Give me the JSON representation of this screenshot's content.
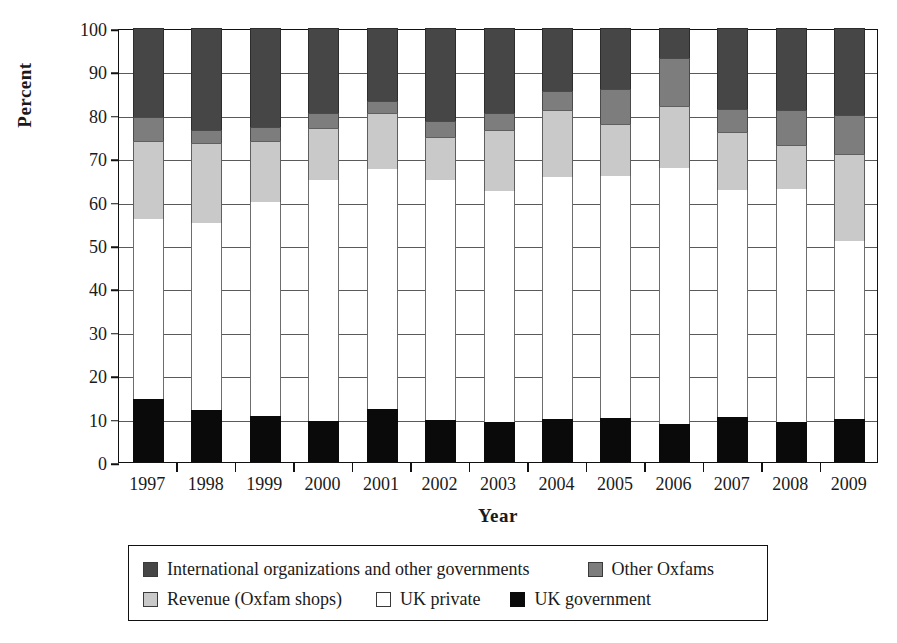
{
  "axes": {
    "ylabel": "Percent",
    "xlabel": "Year",
    "yticks": [
      "0",
      "10",
      "20",
      "30",
      "40",
      "50",
      "60",
      "70",
      "80",
      "90",
      "100"
    ]
  },
  "legend": {
    "items": [
      {
        "label": "International organizations and other governments",
        "key": "intl",
        "color": "#464646"
      },
      {
        "label": "Other Oxfams",
        "key": "other",
        "color": "#7d7d7d"
      },
      {
        "label": "Revenue (Oxfam shops)",
        "key": "shops",
        "color": "#c9c9c9"
      },
      {
        "label": "UK private",
        "key": "priv",
        "color": "#ffffff"
      },
      {
        "label": "UK government",
        "key": "gov",
        "color": "#0a0a0a"
      }
    ]
  },
  "chart_data": {
    "type": "bar",
    "stacked": true,
    "title": "",
    "xlabel": "Year",
    "ylabel": "Percent",
    "ylim": [
      0,
      100
    ],
    "grid": true,
    "legend_position": "bottom",
    "categories": [
      "1997",
      "1998",
      "1999",
      "2000",
      "2001",
      "2002",
      "2003",
      "2004",
      "2005",
      "2006",
      "2007",
      "2008",
      "2009"
    ],
    "series": [
      {
        "name": "UK government",
        "color": "#0a0a0a",
        "values": [
          14.5,
          12.0,
          10.7,
          9.4,
          12.2,
          9.7,
          9.3,
          10.0,
          10.1,
          8.8,
          10.3,
          9.2,
          10.0
        ]
      },
      {
        "name": "UK private",
        "color": "#ffffff",
        "values": [
          41.5,
          43.0,
          49.3,
          55.6,
          55.3,
          55.3,
          53.2,
          55.6,
          55.9,
          59.0,
          52.4,
          53.6,
          41.0
        ]
      },
      {
        "name": "Revenue (Oxfam shops)",
        "color": "#c9c9c9",
        "values": [
          18.0,
          18.5,
          14.0,
          12.0,
          13.0,
          10.0,
          14.0,
          15.4,
          12.0,
          14.2,
          13.3,
          10.2,
          20.0
        ]
      },
      {
        "name": "Other Oxfams",
        "color": "#7d7d7d",
        "values": [
          5.5,
          3.0,
          3.3,
          3.5,
          2.8,
          3.5,
          4.0,
          4.5,
          8.0,
          11.0,
          5.4,
          8.0,
          9.0
        ]
      },
      {
        "name": "International organizations and other governments",
        "color": "#464646",
        "values": [
          20.5,
          23.5,
          22.7,
          19.5,
          16.7,
          21.5,
          19.5,
          14.5,
          14.0,
          7.0,
          18.6,
          19.0,
          20.0
        ]
      }
    ],
    "stack_tops": {
      "1997": {
        "gov": 14.5,
        "priv": 56.0,
        "shops": 74.0,
        "other": 79.5,
        "intl": 100
      },
      "1998": {
        "gov": 12.0,
        "priv": 55.0,
        "shops": 73.5,
        "other": 76.5,
        "intl": 100
      },
      "1999": {
        "gov": 10.7,
        "priv": 60.0,
        "shops": 74.0,
        "other": 77.3,
        "intl": 100
      },
      "2000": {
        "gov": 9.4,
        "priv": 65.0,
        "shops": 77.0,
        "other": 80.5,
        "intl": 100
      },
      "2001": {
        "gov": 12.2,
        "priv": 67.5,
        "shops": 80.5,
        "other": 83.3,
        "intl": 100
      },
      "2002": {
        "gov": 9.7,
        "priv": 65.0,
        "shops": 75.0,
        "other": 78.5,
        "intl": 100
      },
      "2003": {
        "gov": 9.3,
        "priv": 62.5,
        "shops": 76.5,
        "other": 80.5,
        "intl": 100
      },
      "2004": {
        "gov": 10.0,
        "priv": 65.6,
        "shops": 81.0,
        "other": 85.5,
        "intl": 100
      },
      "2005": {
        "gov": 10.1,
        "priv": 66.0,
        "shops": 78.0,
        "other": 86.0,
        "intl": 100
      },
      "2006": {
        "gov": 8.8,
        "priv": 67.8,
        "shops": 82.0,
        "other": 93.0,
        "intl": 100
      },
      "2007": {
        "gov": 10.3,
        "priv": 62.7,
        "shops": 76.0,
        "other": 81.4,
        "intl": 100
      },
      "2008": {
        "gov": 9.2,
        "priv": 62.8,
        "shops": 73.0,
        "other": 81.0,
        "intl": 100
      },
      "2009": {
        "gov": 10.0,
        "priv": 51.0,
        "shops": 71.0,
        "other": 80.0,
        "intl": 100
      }
    }
  }
}
